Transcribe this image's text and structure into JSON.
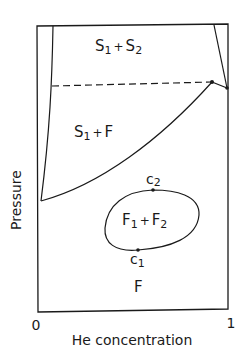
{
  "diagram": {
    "type": "phase_diagram",
    "axes": {
      "xlabel": "He concentration",
      "ylabel": "Pressure",
      "x_ticks": [
        "0",
        "1"
      ]
    },
    "regions": [
      {
        "id": "s1s2",
        "main": "S",
        "sub1": "1",
        "plus": "+",
        "main2": "S",
        "sub2": "2"
      },
      {
        "id": "s1f",
        "main": "S",
        "sub1": "1",
        "plus": "+",
        "main2": "F"
      },
      {
        "id": "f1f2",
        "main": "F",
        "sub1": "1",
        "plus": "+",
        "main2": "F",
        "sub2": "2"
      },
      {
        "id": "f",
        "main": "F"
      }
    ],
    "critical_points": [
      {
        "id": "c2",
        "main": "c",
        "sub": "2"
      },
      {
        "id": "c1",
        "main": "c",
        "sub": "1"
      }
    ],
    "line_color": "#1a1a1a"
  }
}
